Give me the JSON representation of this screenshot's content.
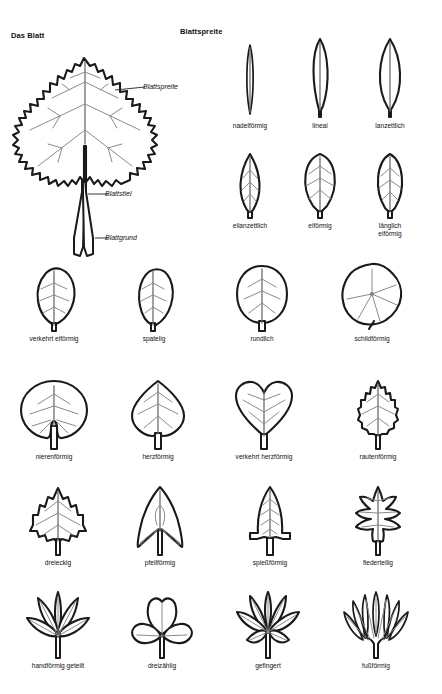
{
  "page": {
    "background_color": "#ffffff",
    "ink_color": "#1a1a1a",
    "vein_color": "#8a8a8a",
    "language": "de"
  },
  "headings": {
    "left": "Das Blatt",
    "right": "Blattspreite"
  },
  "main_leaf": {
    "name": "annotated-leaf-diagram",
    "annotations": [
      {
        "id": "blattspreite",
        "label": "Blattspreite"
      },
      {
        "id": "blattstiel",
        "label": "Blattstiel"
      },
      {
        "id": "blattgrund",
        "label": "Blattgrund"
      }
    ]
  },
  "shapes": [
    {
      "id": "nadelfoermig",
      "label": "nadelförmig",
      "row": 1,
      "col": 2
    },
    {
      "id": "lineal",
      "label": "lineal",
      "row": 1,
      "col": 3
    },
    {
      "id": "lanzettlich",
      "label": "lanzettlich",
      "row": 1,
      "col": 4
    },
    {
      "id": "eilanzettlich",
      "label": "eilanzettlich",
      "row": 2,
      "col": 2
    },
    {
      "id": "eifoermig",
      "label": "eiförmig",
      "row": 2,
      "col": 3
    },
    {
      "id": "laenglich-eifoermig",
      "label": "länglich\neiförmig",
      "row": 2,
      "col": 4
    },
    {
      "id": "verkehrt-eifoermig",
      "label": "verkehrt eiförmig",
      "row": 3,
      "col": 1
    },
    {
      "id": "spatelig",
      "label": "spatelig",
      "row": 3,
      "col": 2
    },
    {
      "id": "rundlich",
      "label": "rundlich",
      "row": 3,
      "col": 3
    },
    {
      "id": "schildfoermig",
      "label": "schildförmig",
      "row": 3,
      "col": 4
    },
    {
      "id": "nierenfoermig",
      "label": "nierenförmig",
      "row": 4,
      "col": 1
    },
    {
      "id": "herzfoermig",
      "label": "herzförmig",
      "row": 4,
      "col": 2
    },
    {
      "id": "verkehrt-herzfoermig",
      "label": "verkehrt herzförmig",
      "row": 4,
      "col": 3
    },
    {
      "id": "rautenfoermig",
      "label": "rautenförmig",
      "row": 4,
      "col": 4
    },
    {
      "id": "dreieckig",
      "label": "dreieckig",
      "row": 5,
      "col": 1
    },
    {
      "id": "pfeilfoermig",
      "label": "pfeilförmig",
      "row": 5,
      "col": 2
    },
    {
      "id": "spiessfoermig",
      "label": "spießförmig",
      "row": 5,
      "col": 3
    },
    {
      "id": "fiederteilig",
      "label": "fiederteilig",
      "row": 5,
      "col": 4
    },
    {
      "id": "handfoermig-geteilt",
      "label": "handförmig geteilt",
      "row": 6,
      "col": 1
    },
    {
      "id": "dreizaehlig",
      "label": "dreizählig",
      "row": 6,
      "col": 2
    },
    {
      "id": "gefingert",
      "label": "gefingert",
      "row": 6,
      "col": 3
    },
    {
      "id": "fussfoermig",
      "label": "fußförmig",
      "row": 6,
      "col": 4
    }
  ]
}
